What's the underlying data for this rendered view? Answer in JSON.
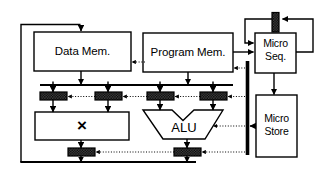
{
  "diagram": {
    "title_hidden": "",
    "data_memory": {
      "label": "Data Mem."
    },
    "program_memory": {
      "label": "Program Mem."
    },
    "micro_sequencer": {
      "line1": "Micro",
      "line2": "Seq."
    },
    "micro_store": {
      "line1": "Micro",
      "line2": "Store"
    },
    "multiplier": {
      "label": "×"
    },
    "alu": {
      "label": "ALU"
    },
    "colors": {
      "line": "#000000",
      "background": "#ffffff",
      "register_fill": "#3a3a3a",
      "register_hatch": "#000000",
      "control_bus": "#000000"
    },
    "registers": {
      "pipeline_top": [
        "reg-mult-a",
        "reg-mult-b",
        "reg-alu-a",
        "reg-alu-b"
      ],
      "pipeline_bottom": [
        "reg-mult-out",
        "reg-alu-out"
      ],
      "sequencer_loop": [
        "reg-micro-pc"
      ]
    },
    "buses": {
      "data_bus_label": "",
      "result_bus_label": "",
      "control_bus_label": ""
    }
  }
}
